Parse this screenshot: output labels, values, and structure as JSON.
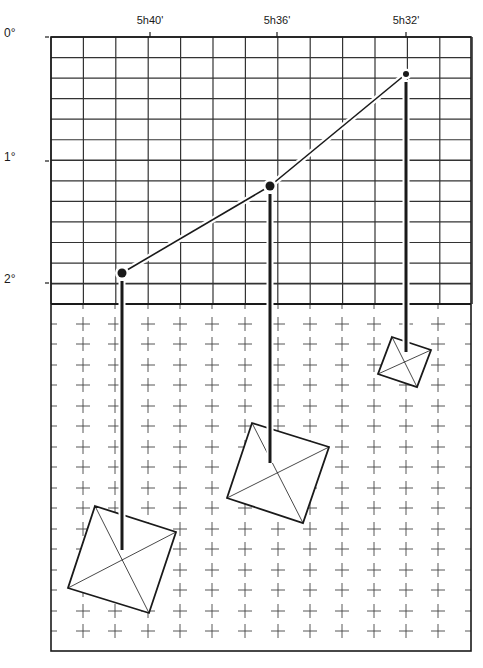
{
  "colors": {
    "background": "#ffffff",
    "ink": "#1a1a1a",
    "grid": "#333333",
    "cross": "#444444"
  },
  "axis": {
    "time_labels": [
      {
        "label": "5h40'",
        "x": 150
      },
      {
        "label": "5h36'",
        "x": 277
      },
      {
        "label": "5h32'",
        "x": 406
      }
    ],
    "declination_labels": [
      {
        "label": "0°",
        "y": 37
      },
      {
        "label": "1°",
        "y": 161
      },
      {
        "label": "2°",
        "y": 283
      }
    ]
  },
  "grid": {
    "left": 51,
    "right": 471,
    "top": 37,
    "bottom": 304,
    "col_step": 32.4,
    "row_step": 20.55,
    "cols": 13,
    "rows": 13
  },
  "cross_field": {
    "left": 51,
    "right": 471,
    "top": 304,
    "bottom": 651,
    "xs": [
      83,
      115,
      148,
      180,
      212,
      245,
      278,
      310,
      342,
      374,
      406,
      438
    ],
    "ys": [
      324,
      344,
      365,
      385,
      406,
      426,
      447,
      467,
      488,
      508,
      529,
      549,
      570,
      590,
      611,
      631
    ],
    "arm": 7
  },
  "track": {
    "points": [
      {
        "label": "5h40'",
        "x": 122,
        "y": 273,
        "r": 4.5
      },
      {
        "label": "5h36'",
        "x": 270,
        "y": 186,
        "r": 4.5
      },
      {
        "label": "5h32'",
        "x": 406,
        "y": 74,
        "r": 3
      }
    ]
  },
  "markers": [
    {
      "name": "5h40'",
      "drop_end_y": 550,
      "corners": [
        [
          95,
          506
        ],
        [
          176,
          532
        ],
        [
          149,
          613
        ],
        [
          68,
          588
        ]
      ]
    },
    {
      "name": "5h36'",
      "drop_end_y": 463,
      "corners": [
        [
          252,
          423
        ],
        [
          329,
          447
        ],
        [
          303,
          523
        ],
        [
          227,
          498
        ]
      ]
    },
    {
      "name": "5h32'",
      "drop_end_y": 352,
      "corners": [
        [
          392,
          337
        ],
        [
          431,
          350
        ],
        [
          417,
          387
        ],
        [
          378,
          374
        ]
      ]
    }
  ]
}
